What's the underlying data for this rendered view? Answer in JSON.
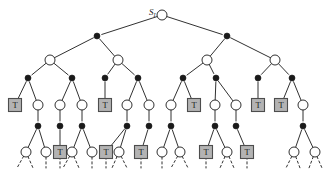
{
  "figure": {
    "root_label_main": "S",
    "root_label_sub": "I",
    "terminal_symbol": "T",
    "colors": {
      "edge": "#1a1a1a",
      "open_node_fill": "#ffffff",
      "open_node_stroke": "#1a1a1a",
      "filled_node_fill": "#1a1a1a",
      "terminal_box_fill": "#b3b3b3",
      "terminal_box_stroke": "#4d4d4d",
      "terminal_text": "#1a1a1a",
      "background": "#ffffff"
    },
    "geometry": {
      "width": 329,
      "height": 178,
      "open_radius": 5,
      "filled_radius": 3,
      "box_size": 13
    }
  },
  "chart_data": {
    "type": "diagram",
    "levels": [
      {
        "level": 0,
        "y": 15,
        "node_type": "open",
        "xs": [
          162
        ]
      },
      {
        "level": 1,
        "y": 36,
        "node_type": "filled",
        "xs": [
          97,
          227
        ]
      },
      {
        "level": 2,
        "y": 60,
        "node_type": "open",
        "xs": [
          50,
          118,
          207,
          275
        ]
      },
      {
        "level": 3,
        "y": 78,
        "node_type": "filled",
        "xs": [
          28,
          72,
          105,
          138,
          183,
          216,
          258,
          292
        ]
      },
      {
        "level": 4,
        "y": 105,
        "node_type": "mixed",
        "nodes": [
          {
            "x": 15,
            "kind": "terminal"
          },
          {
            "x": 38,
            "kind": "open"
          },
          {
            "x": 60,
            "kind": "open"
          },
          {
            "x": 82,
            "kind": "open"
          },
          {
            "x": 105,
            "kind": "terminal"
          },
          {
            "x": 127,
            "kind": "open"
          },
          {
            "x": 149,
            "kind": "open"
          },
          {
            "x": 171,
            "kind": "open"
          },
          {
            "x": 194,
            "kind": "terminal"
          },
          {
            "x": 215,
            "kind": "open"
          },
          {
            "x": 236,
            "kind": "open"
          },
          {
            "x": 258,
            "kind": "terminal"
          },
          {
            "x": 281,
            "kind": "terminal"
          },
          {
            "x": 303,
            "kind": "open"
          }
        ]
      },
      {
        "level": 5,
        "y": 126,
        "node_type": "filled",
        "xs": [
          38,
          60,
          82,
          127,
          149,
          171,
          215,
          236,
          303
        ]
      },
      {
        "level": 6,
        "y": 152,
        "node_type": "mixed",
        "nodes": [
          {
            "x": 26,
            "kind": "open"
          },
          {
            "x": 46,
            "kind": "open"
          },
          {
            "x": 60,
            "kind": "terminal"
          },
          {
            "x": 72,
            "kind": "open"
          },
          {
            "x": 92,
            "kind": "open"
          },
          {
            "x": 106,
            "kind": "terminal"
          },
          {
            "x": 119,
            "kind": "open"
          },
          {
            "x": 141,
            "kind": "terminal"
          },
          {
            "x": 162,
            "kind": "open"
          },
          {
            "x": 180,
            "kind": "open"
          },
          {
            "x": 206,
            "kind": "terminal"
          },
          {
            "x": 227,
            "kind": "open"
          },
          {
            "x": 247,
            "kind": "terminal"
          },
          {
            "x": 294,
            "kind": "open"
          },
          {
            "x": 315,
            "kind": "open"
          }
        ]
      }
    ],
    "edges": [
      [
        162,
        15,
        97,
        36
      ],
      [
        162,
        15,
        227,
        36
      ],
      [
        97,
        36,
        50,
        60
      ],
      [
        97,
        36,
        118,
        60
      ],
      [
        227,
        36,
        207,
        60
      ],
      [
        227,
        36,
        275,
        60
      ],
      [
        50,
        60,
        28,
        78
      ],
      [
        50,
        60,
        72,
        78
      ],
      [
        118,
        60,
        105,
        78
      ],
      [
        118,
        60,
        138,
        78
      ],
      [
        207,
        60,
        183,
        78
      ],
      [
        207,
        60,
        216,
        78
      ],
      [
        275,
        60,
        258,
        78
      ],
      [
        275,
        60,
        292,
        78
      ],
      [
        28,
        78,
        15,
        105
      ],
      [
        28,
        78,
        38,
        105
      ],
      [
        72,
        78,
        60,
        105
      ],
      [
        72,
        78,
        82,
        105
      ],
      [
        105,
        78,
        105,
        105
      ],
      [
        138,
        78,
        127,
        105
      ],
      [
        138,
        78,
        149,
        105
      ],
      [
        183,
        78,
        171,
        105
      ],
      [
        183,
        78,
        194,
        105
      ],
      [
        216,
        78,
        215,
        105
      ],
      [
        216,
        78,
        236,
        105
      ],
      [
        258,
        78,
        258,
        105
      ],
      [
        292,
        78,
        281,
        105
      ],
      [
        292,
        78,
        303,
        105
      ],
      [
        38,
        105,
        38,
        126
      ],
      [
        60,
        105,
        60,
        126
      ],
      [
        82,
        105,
        82,
        126
      ],
      [
        127,
        105,
        127,
        126
      ],
      [
        149,
        105,
        149,
        126
      ],
      [
        171,
        105,
        171,
        126
      ],
      [
        215,
        105,
        215,
        126
      ],
      [
        236,
        105,
        236,
        126
      ],
      [
        303,
        105,
        303,
        126
      ],
      [
        38,
        126,
        26,
        152
      ],
      [
        38,
        126,
        46,
        152
      ],
      [
        60,
        126,
        60,
        152
      ],
      [
        82,
        126,
        72,
        152
      ],
      [
        82,
        126,
        92,
        152
      ],
      [
        127,
        126,
        106,
        152
      ],
      [
        127,
        126,
        119,
        152
      ],
      [
        149,
        126,
        141,
        152
      ],
      [
        171,
        126,
        162,
        152
      ],
      [
        171,
        126,
        180,
        152
      ],
      [
        215,
        126,
        206,
        152
      ],
      [
        215,
        126,
        227,
        152
      ],
      [
        236,
        126,
        247,
        152
      ],
      [
        303,
        126,
        294,
        152
      ],
      [
        303,
        126,
        315,
        152
      ]
    ],
    "stubs": [
      [
        26,
        152,
        17,
        168
      ],
      [
        26,
        152,
        33,
        168
      ],
      [
        46,
        152,
        46,
        168
      ],
      [
        60,
        152,
        60,
        168
      ],
      [
        72,
        152,
        63,
        168
      ],
      [
        72,
        152,
        79,
        168
      ],
      [
        92,
        152,
        92,
        168
      ],
      [
        106,
        152,
        106,
        168
      ],
      [
        119,
        152,
        112,
        168
      ],
      [
        119,
        152,
        127,
        168
      ],
      [
        141,
        152,
        141,
        168
      ],
      [
        162,
        152,
        162,
        168
      ],
      [
        180,
        152,
        171,
        168
      ],
      [
        180,
        152,
        188,
        168
      ],
      [
        206,
        152,
        206,
        168
      ],
      [
        227,
        152,
        220,
        168
      ],
      [
        227,
        152,
        234,
        168
      ],
      [
        247,
        152,
        247,
        168
      ],
      [
        294,
        152,
        286,
        168
      ],
      [
        294,
        152,
        300,
        168
      ],
      [
        315,
        152,
        309,
        168
      ],
      [
        315,
        152,
        322,
        168
      ]
    ],
    "root_label_position": {
      "x": 149,
      "y": 8
    },
    "legend": []
  }
}
